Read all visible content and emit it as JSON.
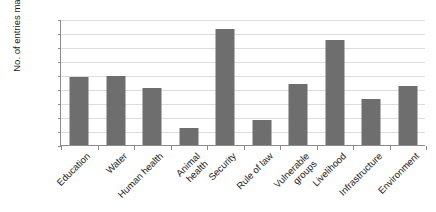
{
  "chart_data": {
    "type": "bar",
    "title": "",
    "xlabel": "",
    "ylabel": "No. of entries mapped",
    "ylim": [
      0,
      450
    ],
    "ytick_step": 50,
    "yticks": [
      0,
      50,
      100,
      150,
      200,
      250,
      300,
      350,
      400,
      450
    ],
    "grid": true,
    "legend": "none",
    "bar_color": "#6e6e6e",
    "gridline_color": "#dcdcdc",
    "axis_color": "#8c8c8c",
    "categories": [
      "Education",
      "Water",
      "Human health",
      "Animal health",
      "Security",
      "Rule of law",
      "Vulnerable groups",
      "Livelihood",
      "Infrastructure",
      "Environment"
    ],
    "values": [
      242,
      248,
      205,
      60,
      415,
      90,
      218,
      375,
      163,
      210
    ]
  }
}
